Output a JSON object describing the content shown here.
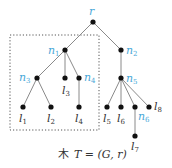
{
  "diagram": {
    "type": "rooted-tree",
    "caption": {
      "kanji": "木",
      "formula": "T = (G, r)"
    },
    "colors": {
      "internal_label": "#4aa8d8",
      "leaf_label": "#333333",
      "edge": "#8a8a8a",
      "node": "#111111"
    },
    "labels": {
      "r": "r",
      "n1": "n",
      "n1_sub": "1",
      "n2": "n",
      "n2_sub": "2",
      "n3": "n",
      "n3_sub": "3",
      "n4": "n",
      "n4_sub": "4",
      "n5": "n",
      "n5_sub": "5",
      "n6": "n",
      "n6_sub": "6",
      "l1": "l",
      "l1_sub": "1",
      "l2": "l",
      "l2_sub": "2",
      "l3": "l",
      "l3_sub": "3",
      "l4": "l",
      "l4_sub": "4",
      "l5": "l",
      "l5_sub": "5",
      "l6": "l",
      "l6_sub": "6",
      "l7": "l",
      "l7_sub": "7",
      "l8": "l",
      "l8_sub": "8"
    },
    "edges": [
      [
        "r",
        "n1"
      ],
      [
        "r",
        "n2"
      ],
      [
        "n1",
        "n3"
      ],
      [
        "n1",
        "l3"
      ],
      [
        "n1",
        "n4"
      ],
      [
        "n3",
        "l1"
      ],
      [
        "n3",
        "l2"
      ],
      [
        "n4",
        "l4"
      ],
      [
        "n2",
        "n5"
      ],
      [
        "n5",
        "l5"
      ],
      [
        "n5",
        "l6"
      ],
      [
        "n5",
        "n6"
      ],
      [
        "n5",
        "l8"
      ],
      [
        "n6",
        "l7"
      ]
    ],
    "highlighted_subtree": {
      "root": "n1",
      "style": "dotted-box"
    }
  }
}
